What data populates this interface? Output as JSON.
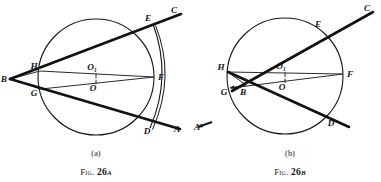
{
  "page": {
    "width": 381,
    "height": 182,
    "background": "#ffffff",
    "ink": "#151515",
    "line_thin": "#2a2a2a"
  },
  "figures": [
    {
      "id": "fig-26a",
      "panel_label": "(a)",
      "caption_fig": "Fig.",
      "caption_num": "26",
      "caption_suffix": "a",
      "circle": {
        "cx": 96,
        "cy": 77,
        "r": 58,
        "stroke_width": 1.1
      },
      "arc_second": {
        "d": "M 153.0 24.0 Q 172.5 76.5 150.0 128.0",
        "stroke_width": 1.1
      },
      "arc_third": {
        "d": "M 155.5 25.5 Q 176.0 76.5 152.5 129.5",
        "stroke_width": 1.0
      },
      "points": [
        {
          "name": "B",
          "label": "B",
          "x": 10,
          "y": 79,
          "lx": 7,
          "ly": 82
        },
        {
          "name": "C",
          "label": "C",
          "x": 177,
          "y": 12,
          "lx": 171,
          "ly": 13
        },
        {
          "name": "A",
          "label": "A",
          "x": 178,
          "y": 130,
          "lx": 174,
          "ly": 132
        },
        {
          "name": "E",
          "label": "E",
          "x": 153,
          "y": 24,
          "lx": 148,
          "ly": 21
        },
        {
          "name": "D",
          "label": "D",
          "x": 150,
          "y": 127,
          "lx": 147,
          "ly": 134
        },
        {
          "name": "F",
          "label": "F",
          "x": 154,
          "y": 77,
          "lx": 158,
          "ly": 80
        },
        {
          "name": "H",
          "label": "H",
          "x": 40,
          "y": 71,
          "lx": 34,
          "ly": 69
        },
        {
          "name": "G",
          "label": "G",
          "x": 41,
          "y": 89,
          "lx": 34,
          "ly": 96
        },
        {
          "name": "O1",
          "label": "O",
          "sub": "1",
          "x": 96,
          "y": 72,
          "lx": 92,
          "ly": 70
        },
        {
          "name": "O",
          "label": "O",
          "x": 96,
          "y": 84,
          "lx": 93,
          "ly": 91
        }
      ],
      "thick_lines": [
        {
          "name": "line-BC",
          "x1": 10,
          "y1": 79,
          "x2": 181,
          "y2": 14,
          "width": 2.6
        },
        {
          "name": "line-BA",
          "x1": 10,
          "y1": 79,
          "x2": 180,
          "y2": 129,
          "width": 2.6
        }
      ],
      "thin_lines": [
        {
          "name": "chord-HF",
          "x1": 40,
          "y1": 71,
          "x2": 154,
          "y2": 77,
          "width": 1.0
        },
        {
          "name": "chord-GF",
          "x1": 41,
          "y1": 89,
          "x2": 154,
          "y2": 77,
          "width": 1.0
        },
        {
          "name": "segment-BH",
          "x1": 10,
          "y1": 79,
          "x2": 40,
          "y2": 71,
          "width": 1.0
        },
        {
          "name": "segment-BG",
          "x1": 10,
          "y1": 79,
          "x2": 41,
          "y2": 89,
          "width": 1.0
        }
      ],
      "tick_marks": [
        {
          "name": "tick-O1",
          "x": 96,
          "y1": 73.5,
          "y2": 78.0
        },
        {
          "name": "tick-O",
          "x": 96,
          "y1": 79.5,
          "y2": 84.0
        }
      ]
    },
    {
      "id": "fig-26b",
      "panel_label": "(b)",
      "caption_fig": "Fig.",
      "caption_num": "26",
      "caption_suffix": "b",
      "circle": {
        "cx": 285,
        "cy": 76,
        "r": 58,
        "stroke_width": 1.1
      },
      "points": [
        {
          "name": "B",
          "label": "B",
          "x": 246,
          "y": 85,
          "lx": 243,
          "ly": 95
        },
        {
          "name": "C",
          "label": "C",
          "x": 369,
          "y": 10,
          "lx": 364,
          "ly": 11
        },
        {
          "name": "A",
          "label": "A",
          "x": 196,
          "y": 127,
          "lx": 194,
          "ly": 130
        },
        {
          "name": "E",
          "label": "E",
          "x": 322,
          "y": 30,
          "lx": 318,
          "ly": 27
        },
        {
          "name": "D",
          "label": "D",
          "x": 330,
          "y": 119,
          "lx": 331,
          "ly": 126
        },
        {
          "name": "F",
          "label": "F",
          "x": 343,
          "y": 74,
          "lx": 347,
          "ly": 77
        },
        {
          "name": "H",
          "label": "H",
          "x": 228,
          "y": 72,
          "lx": 221,
          "ly": 70
        },
        {
          "name": "G",
          "label": "G",
          "x": 231,
          "y": 88,
          "lx": 224,
          "ly": 95
        },
        {
          "name": "O1",
          "label": "O",
          "sub": "1",
          "x": 285,
          "y": 71,
          "lx": 281,
          "ly": 69
        },
        {
          "name": "O",
          "label": "O",
          "x": 285,
          "y": 83,
          "lx": 282,
          "ly": 90
        }
      ],
      "thick_lines": [
        {
          "name": "line-BC",
          "x1": 232,
          "y1": 91,
          "x2": 373,
          "y2": 12,
          "width": 2.6
        },
        {
          "name": "line-BA",
          "x1": 228,
          "y1": 72,
          "x2": 349,
          "y2": 127,
          "width": 2.6
        }
      ],
      "thin_lines": [
        {
          "name": "chord-HF",
          "x1": 228,
          "y1": 72,
          "x2": 343,
          "y2": 74,
          "width": 1.0
        },
        {
          "name": "chord-GF",
          "x1": 231,
          "y1": 88,
          "x2": 343,
          "y2": 74,
          "width": 1.0
        },
        {
          "name": "segment-BH",
          "x1": 246,
          "y1": 85,
          "x2": 228,
          "y2": 72,
          "width": 1.0
        },
        {
          "name": "segment-BG",
          "x1": 246,
          "y1": 85,
          "x2": 231,
          "y2": 88,
          "width": 1.0
        }
      ],
      "arrows": [
        {
          "name": "arrow-B-to-G",
          "x1": 246,
          "y1": 85,
          "x2": 230,
          "y2": 88
        },
        {
          "name": "arrow-to-A",
          "x1": 212,
          "y1": 122,
          "x2": 198,
          "y2": 127
        }
      ],
      "tick_marks": [
        {
          "name": "tick-O1",
          "x": 285,
          "y1": 72.5,
          "y2": 77.0
        },
        {
          "name": "tick-O",
          "x": 285,
          "y1": 78.5,
          "y2": 83.0
        }
      ]
    }
  ]
}
